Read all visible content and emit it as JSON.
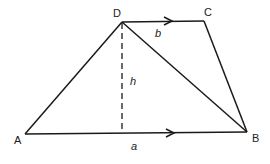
{
  "figure": {
    "type": "trapezium",
    "colors": {
      "line": "#1a1a1a",
      "text": "#222222",
      "background": "#ffffff"
    },
    "vertices": {
      "A": {
        "label": "A",
        "x": 25,
        "y": 134
      },
      "B": {
        "label": "B",
        "x": 247,
        "y": 132
      },
      "C": {
        "label": "C",
        "x": 204,
        "y": 21
      },
      "D": {
        "label": "D",
        "x": 122,
        "y": 22
      }
    },
    "edges": [
      {
        "from": "A",
        "to": "B",
        "label": "a",
        "arrow": true
      },
      {
        "from": "D",
        "to": "C",
        "label": "b",
        "arrow": true
      },
      {
        "from": "A",
        "to": "D"
      },
      {
        "from": "C",
        "to": "B"
      },
      {
        "from": "D",
        "to": "B",
        "note": "diagonal"
      }
    ],
    "height_line": {
      "from": "D",
      "label": "h",
      "style": "dashed"
    },
    "labels": {
      "a": "a",
      "b": "b",
      "h": "h"
    }
  }
}
